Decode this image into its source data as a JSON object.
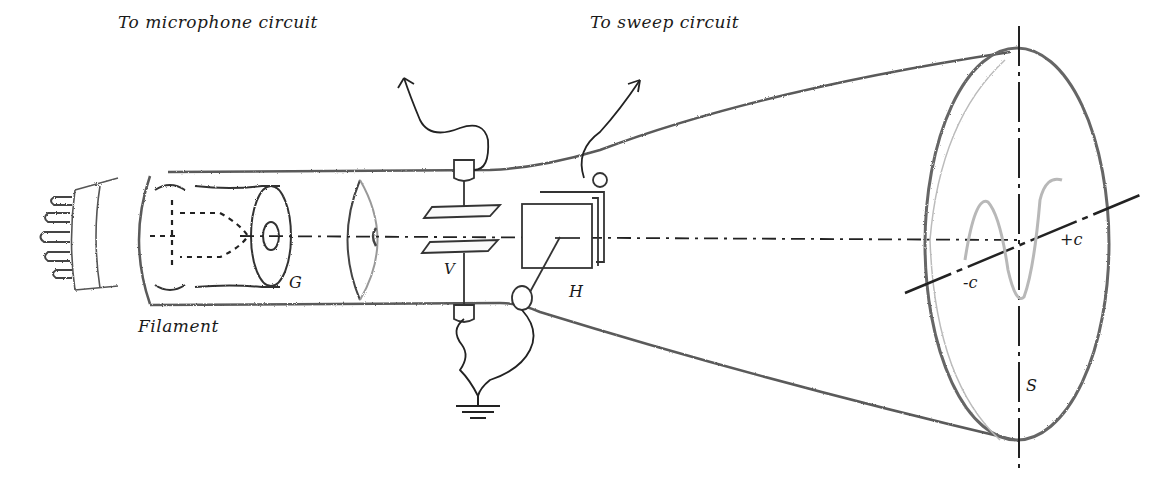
{
  "diagram": {
    "type": "cathode-ray-tube-schematic",
    "labels": {
      "microphone": "To microphone circuit",
      "sweep": "To sweep circuit",
      "filament": "Filament",
      "grid": "G",
      "vertical_plates": "V",
      "horizontal_plates": "H",
      "minus_c": "-c",
      "plus_c": "+c",
      "screen": "S"
    },
    "components": [
      {
        "id": "base-pins",
        "name": "Tube base pins"
      },
      {
        "id": "filament",
        "name": "Filament"
      },
      {
        "id": "grid",
        "name": "Grid / control cylinder G"
      },
      {
        "id": "anode",
        "name": "Accelerating anode disc"
      },
      {
        "id": "vertical-plates",
        "name": "Vertical deflection plates V"
      },
      {
        "id": "horizontal-plates",
        "name": "Horizontal deflection plates H"
      },
      {
        "id": "ground",
        "name": "Ground symbol"
      },
      {
        "id": "screen",
        "name": "Fluorescent screen S"
      },
      {
        "id": "trace",
        "name": "Sine wave trace"
      }
    ],
    "colors": {
      "ink": "#1a1a1a",
      "sketch": "#555555",
      "trace": "#b8b8b8",
      "background": "#ffffff"
    }
  }
}
